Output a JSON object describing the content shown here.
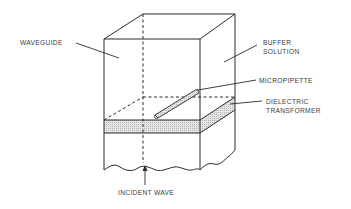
{
  "diagram": {
    "type": "schematic",
    "labels": {
      "waveguide": "WAVEGUIDE",
      "buffer_line1": "BUFFER",
      "buffer_line2": "SOLUTION",
      "micropipette": "MICROPIPETTE",
      "dielectric_line1": "DIELECTRIC",
      "dielectric_line2": "TRANSFORMER",
      "incident_wave": "INCIDENT WAVE"
    },
    "colors": {
      "line": "#2a2a2a",
      "text": "#3a3a3a",
      "layer_fill": "#d8d8d8",
      "background": "#ffffff"
    }
  }
}
